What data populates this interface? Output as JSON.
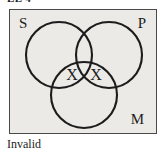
{
  "header": {
    "text": "EE 4"
  },
  "diagram": {
    "type": "venn-three-circle-syllogism",
    "box": {
      "fill_color": "#eceae7",
      "border_color": "#4a4a4a"
    },
    "circle_stroke_color": "#1c1c1c",
    "circles": [
      {
        "id": "S",
        "label": "S",
        "label_position": "top-left",
        "cx": 49,
        "cy": 45,
        "r": 33
      },
      {
        "id": "P",
        "label": "P",
        "label_position": "top-right",
        "cx": 99,
        "cy": 45,
        "r": 33
      },
      {
        "id": "M",
        "label": "M",
        "label_position": "bottom-right",
        "cx": 74,
        "cy": 85,
        "r": 33
      }
    ],
    "marks": [
      {
        "symbol": "X",
        "region": "S-and-M-not-P",
        "x": 62,
        "y": 66
      },
      {
        "symbol": "X",
        "region": "P-and-M-not-S",
        "x": 86,
        "y": 66
      }
    ]
  },
  "caption": {
    "text": "Invalid"
  }
}
